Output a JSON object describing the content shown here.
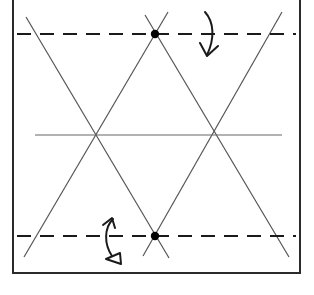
{
  "diagram": {
    "type": "origami-crease-pattern",
    "width": 314,
    "height": 295,
    "colors": {
      "background": "#ffffff",
      "border": "#2a2a2a",
      "crease": "#555555",
      "fold_line": "#1a1a1a",
      "dot": "#000000",
      "arrow": "#1a1a1a"
    },
    "border": {
      "left": 13,
      "right": 300,
      "top": -2,
      "bottom": 273
    },
    "valley_folds": [
      {
        "name": "top-valley-fold",
        "x1": 17,
        "y1": 34,
        "x2": 296,
        "y2": 34
      },
      {
        "name": "bottom-valley-fold",
        "x1": 17,
        "y1": 236,
        "x2": 296,
        "y2": 236
      }
    ],
    "creases": [
      {
        "name": "horizontal-center-crease",
        "x1": 35,
        "y1": 135,
        "x2": 282,
        "y2": 135
      },
      {
        "name": "diagonal-crease-1",
        "x1": 26,
        "y1": 17,
        "x2": 169,
        "y2": 258
      },
      {
        "name": "diagonal-crease-2",
        "x1": 145,
        "y1": 15,
        "x2": 289,
        "y2": 257
      },
      {
        "name": "diagonal-crease-3",
        "x1": 168,
        "y1": 12,
        "x2": 24,
        "y2": 257
      },
      {
        "name": "diagonal-crease-4",
        "x1": 282,
        "y1": 12,
        "x2": 143,
        "y2": 256
      }
    ],
    "points": [
      {
        "name": "top-reference-dot",
        "cx": 155,
        "cy": 34,
        "r": 4
      },
      {
        "name": "bottom-reference-dot",
        "cx": 155,
        "cy": 236,
        "r": 4
      }
    ],
    "arrows": [
      {
        "name": "fold-down-arrow",
        "meaning": "valley fold top edge down"
      },
      {
        "name": "fold-and-unfold-arrow",
        "meaning": "fold and unfold bottom edge"
      }
    ]
  }
}
